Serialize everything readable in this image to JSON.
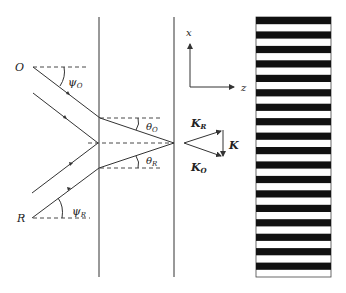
{
  "diagram": {
    "labels": {
      "object_beam": "O",
      "reference_beam": "R",
      "psi_o": "ψ",
      "psi_o_sub": "O",
      "psi_r": "ψ",
      "psi_r_sub": "R",
      "theta_o": "θ",
      "theta_o_sub": "O",
      "theta_r": "θ",
      "theta_r_sub": "R",
      "axis_x": "x",
      "axis_z": "z",
      "k_r": "K",
      "k_r_sub": "R",
      "k_o": "K",
      "k_o_sub": "O",
      "k": "K"
    },
    "colors": {
      "line": "#333333",
      "fringe": "#111111",
      "background": "#ffffff"
    },
    "fringe_count": 18
  }
}
